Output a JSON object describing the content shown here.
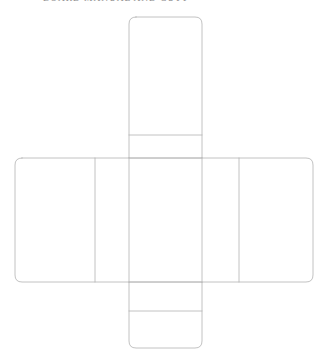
{
  "page": {
    "background_color": "#ffffff"
  },
  "caption": {
    "text": "BOARD MANUAL AND CUTT",
    "note": "clipped at top edge of page"
  },
  "diagram": {
    "name": "box-net-unfolding-pattern",
    "type": "net",
    "shape": "cross",
    "stroke_color": "#b3b3b3",
    "stroke_width": "0.8",
    "fill_color": "#ffffff",
    "corner_radius": "7",
    "panel_count": 6,
    "geometry": {
      "vertical_strip": {
        "x1": 129,
        "x2": 202,
        "y_top": 17,
        "y_bottom": 348
      },
      "horizontal_band": {
        "y1": 158,
        "y2": 282,
        "x_left": 15,
        "x_right": 313
      },
      "vertical_dividers_x": [
        95,
        239
      ],
      "horizontal_dividers_y": [
        135,
        311
      ]
    },
    "panels": [
      {
        "id": "top-flap",
        "label": ""
      },
      {
        "id": "top-face",
        "label": ""
      },
      {
        "id": "left-face",
        "label": ""
      },
      {
        "id": "front-face",
        "label": ""
      },
      {
        "id": "right-face",
        "label": ""
      },
      {
        "id": "bottom-flap",
        "label": ""
      }
    ]
  }
}
